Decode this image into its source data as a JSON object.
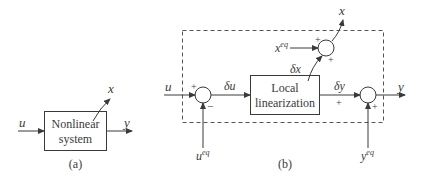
{
  "diagram": {
    "panel_a": {
      "caption": "(a)",
      "block_line1": "Nonlinear",
      "block_line2": "system",
      "input": "u",
      "output": "y",
      "state": "x"
    },
    "panel_b": {
      "caption": "(b)",
      "block_line1": "Local",
      "block_line2": "linearization",
      "input": "u",
      "input_eq_base": "u",
      "input_eq_sup": "eq",
      "delta_u": "δu",
      "delta_x": "δx",
      "delta_y": "δy",
      "state_eq_base": "x",
      "state_eq_sup": "eq",
      "output_eq_base": "y",
      "output_eq_sup": "eq",
      "state_out": "x",
      "output": "y",
      "sum1_signs": {
        "left": "+",
        "bottom": "−"
      },
      "sum2_signs": {
        "left": "+",
        "bottom": "+"
      },
      "sum3_signs": {
        "left": "+",
        "bottom": "+"
      }
    }
  }
}
